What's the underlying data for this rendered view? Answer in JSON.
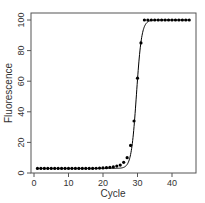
{
  "chart_data": {
    "type": "scatter",
    "title": "",
    "xlabel": "Cycle",
    "ylabel": "Fluorescence",
    "xlim": [
      0,
      46
    ],
    "ylim": [
      0,
      100
    ],
    "xticks": [
      0,
      10,
      20,
      30,
      40
    ],
    "yticks": [
      0,
      20,
      40,
      60,
      80,
      100
    ],
    "grid": false,
    "legend": null,
    "series": [
      {
        "name": "observed",
        "style": "points",
        "color": "#000000",
        "x": [
          1,
          2,
          3,
          4,
          5,
          6,
          7,
          8,
          9,
          10,
          11,
          12,
          13,
          14,
          15,
          16,
          17,
          18,
          19,
          20,
          21,
          22,
          23,
          24,
          25,
          26,
          27,
          28,
          29,
          30,
          31,
          32,
          33,
          34,
          35,
          36,
          37,
          38,
          39,
          40,
          41,
          42,
          43,
          44,
          45
        ],
        "y": [
          3,
          3,
          3,
          3,
          3,
          3,
          3,
          3,
          3,
          3,
          3,
          3,
          3,
          3,
          3,
          3,
          3,
          3.1,
          3.2,
          3.3,
          3.5,
          3.7,
          4,
          4.5,
          5.2,
          7,
          10,
          18,
          34,
          62,
          85,
          100,
          100,
          100,
          100,
          100,
          100,
          100,
          100,
          100,
          100,
          100,
          100,
          100,
          100
        ]
      },
      {
        "name": "fitted sigmoid",
        "style": "line",
        "color": "#000000"
      }
    ]
  }
}
